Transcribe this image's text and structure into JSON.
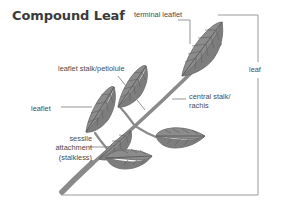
{
  "diagram": {
    "title": "Compound Leaf",
    "type": "botanical-illustration",
    "labels": {
      "terminal_leaflet": "terminal leaflet",
      "leaflet_stalk": "leaflet stalk/petiolule",
      "leaflet": "leaflet",
      "sessile_line1": "sessile",
      "sessile_line2": "attachment",
      "sessile_line3": "(stalkless)",
      "central_stalk_line1": "central stalk/",
      "central_stalk_line2": "rachis",
      "leaf_bracket": "leaf"
    },
    "colors": {
      "title_text": "#3a3a3a",
      "label_text": "#4a4a4a",
      "leaf_fill": "#8c8c8c",
      "leaf_fill_dark": "#7a7a7a",
      "leaf_outline": "#6e6e6e",
      "vein": "#5f5f5f",
      "stem": "#8a8a8a",
      "leader_line": "#8a8a8a",
      "bracket_line": "#9a9a9a",
      "background": "#ffffff"
    }
  }
}
